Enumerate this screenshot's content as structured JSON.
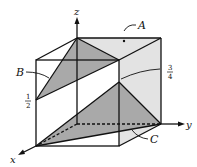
{
  "diagram": {
    "type": "3d-unit-cube-with-planes",
    "axes": {
      "x": "x",
      "y": "y",
      "z": "z"
    },
    "planes": [
      {
        "label": "A",
        "shade": "light"
      },
      {
        "label": "B",
        "shade": "dark"
      },
      {
        "label": "C",
        "shade": "dark"
      }
    ],
    "marks": [
      {
        "label_num": "1",
        "label_den": "2",
        "edge": "front-left vertical"
      },
      {
        "label_num": "3",
        "label_den": "4",
        "edge": "front-right vertical"
      }
    ],
    "colors": {
      "edge": "#111111",
      "light_plane": "#e3e3e3",
      "dark_plane": "#a9a9a9",
      "background": "#ffffff"
    }
  }
}
